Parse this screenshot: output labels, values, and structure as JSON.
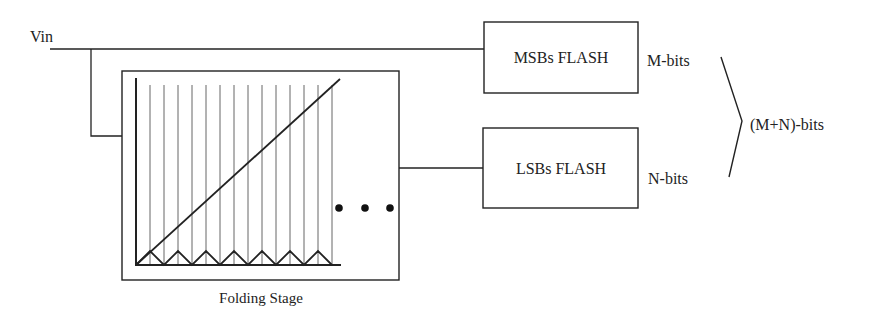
{
  "diagram": {
    "input": {
      "label": "Vin"
    },
    "folding_stage": {
      "label": "Folding Stage",
      "graph": {
        "reference_lines": 14,
        "folds": 7,
        "ramp": "linear input",
        "output": "triangular folded signal"
      },
      "continuation": "• • •"
    },
    "blocks": [
      {
        "id": "msb",
        "label": "MSBs FLASH",
        "output_label": "M-bits"
      },
      {
        "id": "lsb",
        "label": "LSBs FLASH",
        "output_label": "N-bits"
      }
    ],
    "combined_output": {
      "label": "(M+N)-bits"
    },
    "colors": {
      "stroke": "#222222",
      "thin_stroke": "#555555",
      "background": "#ffffff"
    }
  }
}
